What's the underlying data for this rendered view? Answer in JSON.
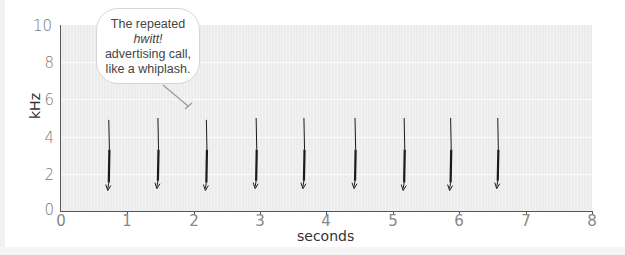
{
  "chart_data": {
    "type": "scatter",
    "title": "",
    "xlabel": "seconds",
    "ylabel": "kHz",
    "xlim": [
      0,
      8
    ],
    "ylim": [
      0,
      10
    ],
    "x_ticks": [
      "0",
      "1",
      "2",
      "3",
      "4",
      "5",
      "6",
      "7",
      "8"
    ],
    "y_ticks": [
      "0",
      "2",
      "4",
      "6",
      "8",
      "10"
    ],
    "grid": true,
    "legend": null,
    "series": [
      {
        "name": "hwitt! call (descending frequency sweep)",
        "calls": [
          {
            "t": 0.72,
            "f_start_khz": 4.9,
            "f_end_khz": 1.1
          },
          {
            "t": 1.46,
            "f_start_khz": 5.0,
            "f_end_khz": 1.2
          },
          {
            "t": 2.19,
            "f_start_khz": 4.9,
            "f_end_khz": 1.1
          },
          {
            "t": 2.94,
            "f_start_khz": 5.0,
            "f_end_khz": 1.2
          },
          {
            "t": 3.66,
            "f_start_khz": 5.0,
            "f_end_khz": 1.2
          },
          {
            "t": 4.43,
            "f_start_khz": 5.0,
            "f_end_khz": 1.2
          },
          {
            "t": 5.17,
            "f_start_khz": 5.0,
            "f_end_khz": 1.1
          },
          {
            "t": 5.87,
            "f_start_khz": 5.0,
            "f_end_khz": 1.1
          },
          {
            "t": 6.58,
            "f_start_khz": 5.0,
            "f_end_khz": 1.2
          }
        ]
      }
    ],
    "annotations": [
      {
        "text": "The repeated hwitt! advertising call, like a whiplash.",
        "points_to": {
          "t": 1.9,
          "khz": 5.5
        }
      }
    ]
  },
  "callout": {
    "line1_prefix": "The repeated ",
    "line1_italic": "hwitt!",
    "line2": "advertising call,",
    "line3": "like a whiplash."
  },
  "axes": {
    "xlabel": "seconds",
    "ylabel": "kHz",
    "x_ticks": [
      "0",
      "1",
      "2",
      "3",
      "4",
      "5",
      "6",
      "7",
      "8"
    ],
    "y_ticks": [
      "0",
      "2",
      "4",
      "6",
      "8",
      "10"
    ]
  },
  "colors": {
    "plot_bg": "#ececec",
    "call_ink": "#1a1a1a",
    "axis": "#555555"
  }
}
